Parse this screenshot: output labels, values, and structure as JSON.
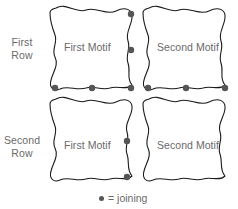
{
  "diagram": {
    "stroke_color": "#1a1a1a",
    "text_color": "#6a6a6a",
    "dot_color": "#555555",
    "background_color": "#ffffff",
    "rows": [
      {
        "label_line1": "First",
        "label_line2": "Row",
        "motifs": [
          {
            "label": "First Motif"
          },
          {
            "label": "Second Motif"
          }
        ]
      },
      {
        "label_line1": "Second",
        "label_line2": "Row",
        "motifs": [
          {
            "label": "First Motif"
          },
          {
            "label": "Second Motif"
          }
        ]
      }
    ],
    "joining_dots": [
      {
        "x": 131,
        "y": 14,
        "where": "row1-motif1-right-top"
      },
      {
        "x": 131,
        "y": 50,
        "where": "row1-motif1-right-middle"
      },
      {
        "x": 131,
        "y": 88,
        "where": "row1-motif1-bottom-right-corner"
      },
      {
        "x": 92,
        "y": 88,
        "where": "row1-motif1-bottom-middle"
      },
      {
        "x": 55,
        "y": 88,
        "where": "row1-motif1-bottom-left-corner"
      },
      {
        "x": 225,
        "y": 88,
        "where": "row1-motif2-bottom-right-corner"
      },
      {
        "x": 186,
        "y": 88,
        "where": "row1-motif2-bottom-middle"
      },
      {
        "x": 148,
        "y": 88,
        "where": "row1-motif2-bottom-left-corner"
      },
      {
        "x": 127,
        "y": 141,
        "where": "row2-motif1-right-middle-upper"
      },
      {
        "x": 127,
        "y": 177,
        "where": "row2-motif1-right-lower"
      }
    ],
    "legend": {
      "dot_symbol": "joining-dot-icon",
      "text": "= joining"
    }
  }
}
